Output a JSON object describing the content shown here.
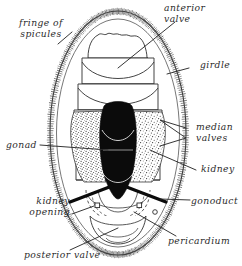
{
  "figure": {
    "view": "ventral view of chiton body showing valves, girdle and internal organs",
    "ink_color": "#2b2b2b",
    "fill_black": "#0b0b0b",
    "background": "#ffffff"
  },
  "labels": {
    "fringe_of_spicules": "fringe of\nspicules",
    "anterior_valve": "anterior\nvalve",
    "girdle": "girdle",
    "median_valves": "median\nvalves",
    "gonad": "gonad",
    "kidney": "kidney",
    "gonoduct": "gonoduct",
    "kidney_opening": "kidney\nopening",
    "pericardium": "pericardium",
    "posterior_valve": "posterior valve"
  },
  "structures": [
    {
      "name": "body-outline",
      "description": "outer elongated oval body wall"
    },
    {
      "name": "spicule-fringe",
      "description": "hatched band of short spicules around body margin"
    },
    {
      "name": "girdle",
      "description": "smooth band between spicule fringe and valve series"
    },
    {
      "name": "anterior-valve",
      "description": "scalloped shell plate at head end"
    },
    {
      "name": "median-valves",
      "description": "series of median shell plates across the body"
    },
    {
      "name": "posterior-valve",
      "description": "shell plate at tail end"
    },
    {
      "name": "gonad",
      "description": "solid black median organ"
    },
    {
      "name": "kidney",
      "description": "stippled paired organs flanking the gonad"
    },
    {
      "name": "gonoduct",
      "description": "thick black paired ducts running posterolaterally"
    },
    {
      "name": "kidney-opening",
      "description": "small square pore markers on each side"
    },
    {
      "name": "pericardium",
      "description": "dashed outlined chamber near the posterior end"
    }
  ]
}
